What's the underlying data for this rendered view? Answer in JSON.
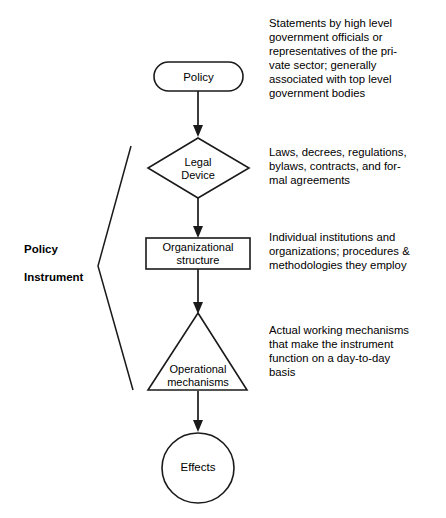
{
  "diagram": {
    "title": "Policy Instrument",
    "type": "flowchart",
    "stroke_color": "#1a1a1a",
    "background_color": "#ffffff",
    "side_label": {
      "line1": "Policy",
      "line2": "Instrument"
    },
    "nodes": [
      {
        "id": "policy",
        "shape": "stadium",
        "label_lines": [
          "Policy"
        ]
      },
      {
        "id": "legal-device",
        "shape": "diamond",
        "label_lines": [
          "Legal",
          "Device"
        ]
      },
      {
        "id": "organizational-structure",
        "shape": "rectangle",
        "label_lines": [
          "Organizational",
          "structure"
        ]
      },
      {
        "id": "operational-mechanisms",
        "shape": "triangle",
        "label_lines": [
          "Operational",
          "mechanisms"
        ]
      },
      {
        "id": "effects",
        "shape": "ellipse",
        "label_lines": [
          "Effects"
        ]
      }
    ],
    "annotations": [
      {
        "id": "policy-annotation",
        "lines": [
          "Statements by high level",
          "government officials or",
          "representatives of the pri-",
          "vate sector; generally",
          "associated with top level",
          "government bodies"
        ]
      },
      {
        "id": "legal-device-annotation",
        "lines": [
          "Laws, decrees, regulations,",
          "bylaws, contracts, and for-",
          "mal agreements"
        ]
      },
      {
        "id": "organizational-structure-annotation",
        "lines": [
          "Individual institutions and",
          "organizations; procedures &",
          "methodologies they employ"
        ]
      },
      {
        "id": "operational-mechanisms-annotation",
        "lines": [
          "Actual working mechanisms",
          "that make the instrument",
          "function on a day-to-day",
          "basis"
        ]
      }
    ]
  }
}
